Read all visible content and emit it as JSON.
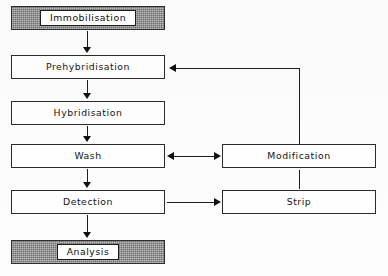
{
  "diagram": {
    "type": "flowchart",
    "orientation": "top-to-bottom with right-hand recycling branch",
    "nodes": [
      {
        "id": "immobilisation",
        "label": "Immobilisation",
        "style": "shaded",
        "column": "left",
        "x": 11,
        "y": 6,
        "w": 154,
        "h": 24
      },
      {
        "id": "prehybridisation",
        "label": "Prehybridisation",
        "style": "plain",
        "column": "left",
        "x": 11,
        "y": 55,
        "w": 154,
        "h": 24
      },
      {
        "id": "hybridisation",
        "label": "Hybridisation",
        "style": "plain",
        "column": "left",
        "x": 11,
        "y": 101,
        "w": 154,
        "h": 24
      },
      {
        "id": "wash",
        "label": "Wash",
        "style": "plain",
        "column": "left",
        "x": 11,
        "y": 144,
        "w": 154,
        "h": 24
      },
      {
        "id": "detection",
        "label": "Detection",
        "style": "plain",
        "column": "left",
        "x": 11,
        "y": 190,
        "w": 154,
        "h": 24
      },
      {
        "id": "analysis",
        "label": "Analysis",
        "style": "shaded",
        "column": "left",
        "x": 11,
        "y": 240,
        "w": 154,
        "h": 24
      },
      {
        "id": "modification",
        "label": "Modification",
        "style": "plain",
        "column": "right",
        "x": 222,
        "y": 144,
        "w": 154,
        "h": 24
      },
      {
        "id": "strip",
        "label": "Strip",
        "style": "plain",
        "column": "right",
        "x": 222,
        "y": 190,
        "w": 154,
        "h": 24
      }
    ],
    "edges": [
      {
        "id": "e-immobilisation-prehybridisation",
        "from": "immobilisation",
        "to": "prehybridisation",
        "kind": "arrow-down"
      },
      {
        "id": "e-prehybridisation-hybridisation",
        "from": "prehybridisation",
        "to": "hybridisation",
        "kind": "arrow-down"
      },
      {
        "id": "e-hybridisation-wash",
        "from": "hybridisation",
        "to": "wash",
        "kind": "arrow-down"
      },
      {
        "id": "e-wash-detection",
        "from": "wash",
        "to": "detection",
        "kind": "arrow-down"
      },
      {
        "id": "e-detection-analysis",
        "from": "detection",
        "to": "analysis",
        "kind": "arrow-down"
      },
      {
        "id": "e-wash-modification",
        "from": "wash",
        "to": "modification",
        "kind": "arrow-both-horizontal"
      },
      {
        "id": "e-detection-strip",
        "from": "detection",
        "to": "strip",
        "kind": "arrow-right"
      },
      {
        "id": "e-modification-strip",
        "from": "modification",
        "to": "strip",
        "kind": "line-vertical"
      },
      {
        "id": "e-modification-prehybridisation",
        "from": "modification",
        "to": "prehybridisation",
        "kind": "elbow-arrow-left"
      }
    ],
    "colors": {
      "line": "#1d1d1d",
      "box_border": "#2b2b2b",
      "box_fill": "#ffffff",
      "shaded_fill": "#8d8d8d",
      "text": "#141414",
      "background": "#ffffff"
    }
  }
}
